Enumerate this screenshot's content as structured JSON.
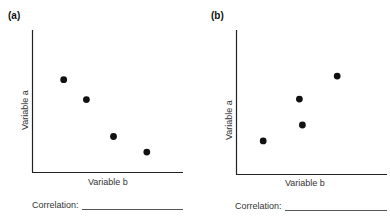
{
  "chart_data": [
    {
      "type": "scatter",
      "panel_label": "(a)",
      "xlabel": "Variable b",
      "ylabel": "Variable a",
      "grid": false,
      "ticks": false,
      "xlim": [
        0,
        10
      ],
      "ylim": [
        0,
        10
      ],
      "points": [
        {
          "x": 2.1,
          "y": 6.5
        },
        {
          "x": 3.6,
          "y": 5.1
        },
        {
          "x": 5.4,
          "y": 2.5
        },
        {
          "x": 7.6,
          "y": 1.4
        }
      ],
      "footer": {
        "label": "Correlation:",
        "blank": ""
      }
    },
    {
      "type": "scatter",
      "panel_label": "(b)",
      "xlabel": "Variable b",
      "ylabel": "Variable a",
      "grid": false,
      "ticks": false,
      "xlim": [
        0,
        10
      ],
      "ylim": [
        0,
        10
      ],
      "points": [
        {
          "x": 1.8,
          "y": 2.3
        },
        {
          "x": 4.2,
          "y": 5.2
        },
        {
          "x": 4.4,
          "y": 3.4
        },
        {
          "x": 6.7,
          "y": 6.8
        }
      ],
      "footer": {
        "label": "Correlation:",
        "blank": ""
      }
    }
  ]
}
